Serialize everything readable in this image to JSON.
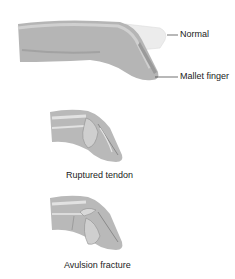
{
  "diagram": {
    "top_figure": {
      "labels": [
        {
          "text": "Normal"
        },
        {
          "text": "Mallet finger"
        }
      ]
    },
    "middle_figure": {
      "caption": "Ruptured tendon"
    },
    "bottom_figure": {
      "caption": "Avulsion fracture"
    },
    "colors": {
      "skin": "#b8b8b8",
      "skin_light": "#d6d6d6",
      "normal_outline": "#e8e8e8",
      "bone": "#cfcfcf",
      "tendon": "#e4e4e4",
      "line": "#333333"
    }
  }
}
